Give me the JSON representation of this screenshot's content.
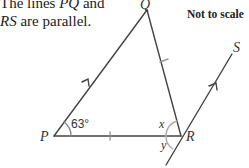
{
  "question": {
    "intro_line1_prefix": "The lines ",
    "intro_line1_var": "PQ",
    "intro_line1_suffix": " and",
    "intro_line2_var": "RS",
    "intro_line2_suffix": " are parallel."
  },
  "note": "Not to scale",
  "diagram": {
    "points": {
      "P": "P",
      "Q": "Q",
      "R": "R",
      "S": "S"
    },
    "angle_P": "63°",
    "angle_x": "x",
    "angle_y": "y",
    "line_color": "#444444"
  }
}
